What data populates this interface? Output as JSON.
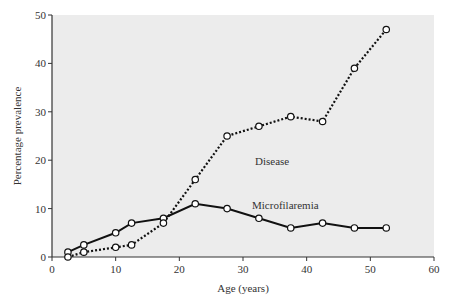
{
  "chart_data": {
    "type": "line",
    "title": "",
    "xlabel": "Age (years)",
    "ylabel": "Percentage prevalence",
    "xlim": [
      0,
      60
    ],
    "ylim": [
      0,
      50
    ],
    "xticks": [
      0,
      10,
      20,
      30,
      40,
      50,
      60
    ],
    "yticks": [
      0,
      10,
      20,
      30,
      40,
      50
    ],
    "grid": false,
    "legend": "inline labels",
    "series": [
      {
        "name": "Microfilaremia",
        "style": "solid",
        "marker": "open-circle",
        "x": [
          2.5,
          5,
          10,
          12.5,
          17.5,
          22.5,
          27.5,
          32.5,
          37.5,
          42.5,
          47.5,
          52.5
        ],
        "values": [
          1,
          2.5,
          5,
          7,
          8,
          11,
          10,
          8,
          6,
          7,
          6,
          6
        ]
      },
      {
        "name": "Disease",
        "style": "dotted",
        "marker": "open-circle",
        "x": [
          2.5,
          5,
          10,
          12.5,
          17.5,
          22.5,
          27.5,
          32.5,
          37.5,
          42.5,
          47.5,
          52.5
        ],
        "values": [
          0,
          1,
          2,
          2.5,
          7,
          16,
          25,
          27,
          29,
          28,
          39,
          47
        ]
      }
    ],
    "annotations": [
      {
        "text": "Disease",
        "x": 33,
        "y": 32
      },
      {
        "text": "Microfilaremia",
        "x": 34,
        "y": 10.5
      }
    ]
  },
  "labels": {
    "xlabel": "Age (years)",
    "ylabel": "Percentage prevalence",
    "disease": "Disease",
    "microfilaremia": "Microfilaremia"
  },
  "colors": {
    "plot_bg": "#ececec",
    "line": "#111111",
    "axis": "#333333"
  }
}
